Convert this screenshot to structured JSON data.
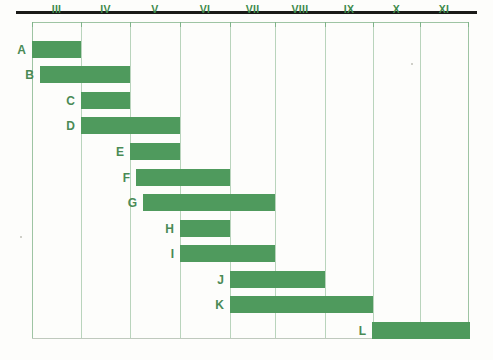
{
  "figure": {
    "type": "gantt-chart",
    "bar_color": "#4f9a5d",
    "grid_color": "#9ec4a3",
    "label_color": "#3f8b4c",
    "background": "#fdfdfb"
  },
  "axis": {
    "name": "month-axis",
    "ticks": [
      "III",
      "IV",
      "V",
      "VI",
      "VII",
      "VIII",
      "IX",
      "X",
      "XI"
    ],
    "tick_positions_px": [
      32,
      81,
      130,
      180,
      230,
      275,
      325,
      373,
      420,
      468
    ],
    "plot_left_px": 32,
    "plot_right_px": 468
  },
  "rows": [
    {
      "label": "A",
      "start_px": 32,
      "end_px": 81,
      "top_px": 41,
      "height_px": 17
    },
    {
      "label": "B",
      "start_px": 40,
      "end_px": 130,
      "top_px": 66,
      "height_px": 17
    },
    {
      "label": "C",
      "start_px": 81,
      "end_px": 130,
      "top_px": 92,
      "height_px": 17
    },
    {
      "label": "D",
      "start_px": 81,
      "end_px": 180,
      "top_px": 117,
      "height_px": 17
    },
    {
      "label": "E",
      "start_px": 130,
      "end_px": 180,
      "top_px": 143,
      "height_px": 17
    },
    {
      "label": "F",
      "start_px": 136,
      "end_px": 230,
      "top_px": 169,
      "height_px": 17
    },
    {
      "label": "G",
      "start_px": 143,
      "end_px": 275,
      "top_px": 194,
      "height_px": 17
    },
    {
      "label": "H",
      "start_px": 180,
      "end_px": 230,
      "top_px": 220,
      "height_px": 17
    },
    {
      "label": "I",
      "start_px": 180,
      "end_px": 275,
      "top_px": 245,
      "height_px": 17
    },
    {
      "label": "J",
      "start_px": 230,
      "end_px": 325,
      "top_px": 271,
      "height_px": 17
    },
    {
      "label": "K",
      "start_px": 230,
      "end_px": 373,
      "top_px": 296,
      "height_px": 17
    },
    {
      "label": "L",
      "start_px": 372,
      "end_px": 470,
      "top_px": 322,
      "height_px": 17
    }
  ],
  "chart_data": {
    "type": "bar",
    "title": "",
    "xlabel": "",
    "ylabel": "",
    "orientation": "horizontal",
    "categories": [
      "A",
      "B",
      "C",
      "D",
      "E",
      "F",
      "G",
      "H",
      "I",
      "J",
      "K",
      "L"
    ],
    "x_tick_labels": [
      "III",
      "IV",
      "V",
      "VI",
      "VII",
      "VIII",
      "IX",
      "X",
      "XI"
    ],
    "x_axis_units": "month (roman numeral)",
    "xlim": [
      3,
      12
    ],
    "grid": true,
    "legend": "none",
    "series": [
      {
        "name": "task-duration",
        "intervals": [
          {
            "task": "A",
            "start": 3.0,
            "end": 4.0,
            "duration": 1.0
          },
          {
            "task": "B",
            "start": 3.16,
            "end": 5.0,
            "duration": 1.84
          },
          {
            "task": "C",
            "start": 4.0,
            "end": 5.0,
            "duration": 1.0
          },
          {
            "task": "D",
            "start": 4.0,
            "end": 6.0,
            "duration": 2.0
          },
          {
            "task": "E",
            "start": 5.0,
            "end": 6.0,
            "duration": 1.0
          },
          {
            "task": "F",
            "start": 5.12,
            "end": 7.0,
            "duration": 1.88
          },
          {
            "task": "G",
            "start": 5.26,
            "end": 8.0,
            "duration": 2.74
          },
          {
            "task": "H",
            "start": 6.0,
            "end": 7.0,
            "duration": 1.0
          },
          {
            "task": "I",
            "start": 6.0,
            "end": 8.0,
            "duration": 2.0
          },
          {
            "task": "J",
            "start": 7.0,
            "end": 9.0,
            "duration": 2.0
          },
          {
            "task": "K",
            "start": 7.0,
            "end": 10.0,
            "duration": 3.0
          },
          {
            "task": "L",
            "start": 9.98,
            "end": 12.0,
            "duration": 2.02
          }
        ]
      }
    ]
  }
}
